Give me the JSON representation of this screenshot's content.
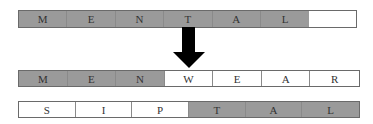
{
  "diagram": {
    "source_word": {
      "cells": [
        {
          "letter": "M",
          "shade": "gray"
        },
        {
          "letter": "E",
          "shade": "gray"
        },
        {
          "letter": "N",
          "shade": "gray"
        },
        {
          "letter": "T",
          "shade": "gray"
        },
        {
          "letter": "A",
          "shade": "gray"
        },
        {
          "letter": "L",
          "shade": "gray"
        }
      ]
    },
    "arrow": {
      "direction": "down",
      "icon": "down-arrow-icon"
    },
    "result_word_1": {
      "cells": [
        {
          "letter": "M",
          "shade": "gray"
        },
        {
          "letter": "E",
          "shade": "gray"
        },
        {
          "letter": "N",
          "shade": "gray"
        },
        {
          "letter": "W",
          "shade": "white"
        },
        {
          "letter": "E",
          "shade": "white"
        },
        {
          "letter": "A",
          "shade": "white"
        },
        {
          "letter": "R",
          "shade": "white"
        }
      ]
    },
    "result_word_2": {
      "cells": [
        {
          "letter": "S",
          "shade": "white"
        },
        {
          "letter": "I",
          "shade": "white"
        },
        {
          "letter": "P",
          "shade": "white"
        },
        {
          "letter": "T",
          "shade": "gray"
        },
        {
          "letter": "A",
          "shade": "gray"
        },
        {
          "letter": "L",
          "shade": "gray"
        }
      ]
    },
    "colors": {
      "gray": "#9a9a9a",
      "white": "#ffffff",
      "arrow": "#000000"
    }
  }
}
